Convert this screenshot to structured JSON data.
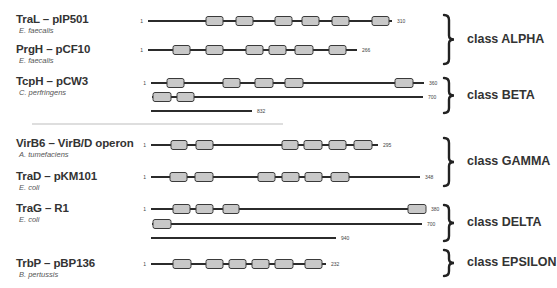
{
  "proteins": [
    {
      "name": "TraL – pIP501",
      "organism": "E. faecalis",
      "class": "ALPHA",
      "label_y": 13,
      "tracks": [
        {
          "y": 21,
          "x0": 148,
          "x1": 392,
          "start": "1",
          "end": "310",
          "domains": [
            [
              206,
              223
            ],
            [
              236,
              253
            ],
            [
              275,
              292
            ],
            [
              302,
              319
            ],
            [
              332,
              349
            ],
            [
              372,
              389
            ]
          ]
        }
      ]
    },
    {
      "name": "PrgH – pCF10",
      "organism": "E. faecalis",
      "class": "ALPHA",
      "label_y": 43,
      "tracks": [
        {
          "y": 50,
          "x0": 148,
          "x1": 357,
          "start": "1",
          "end": "266",
          "domains": [
            [
              173,
              190
            ],
            [
              206,
              223
            ],
            [
              246,
              263
            ],
            [
              269,
              286
            ],
            [
              295,
              313
            ],
            [
              329,
              346
            ]
          ]
        }
      ]
    },
    {
      "name": "TcpH – pCW3",
      "organism": "C. perfringens",
      "class": "BETA",
      "label_y": 75,
      "tracks": [
        {
          "y": 83,
          "x0": 151,
          "x1": 424,
          "start": "1",
          "end": "360",
          "domains": [
            [
              167,
              184
            ],
            [
              223,
              240
            ],
            [
              255,
              273
            ],
            [
              285,
              303
            ],
            [
              395,
              413
            ]
          ]
        },
        {
          "y": 97,
          "x0": 152,
          "x1": 423,
          "start": "",
          "end": "700",
          "domains": [
            [
              153,
              171
            ],
            [
              177,
              194
            ]
          ]
        },
        {
          "y": 111,
          "x0": 151,
          "x1": 252,
          "start": "",
          "end": "832",
          "domains": []
        }
      ]
    },
    {
      "name": "VirB6 – VirB/D operon",
      "organism": "A. tumefaciens",
      "class": "GAMMA",
      "label_y": 137,
      "tracks": [
        {
          "y": 145,
          "x0": 151,
          "x1": 378,
          "start": "1",
          "end": "295",
          "domains": [
            [
              171,
              187
            ],
            [
              196,
              213
            ],
            [
              282,
              298
            ],
            [
              304,
              322
            ],
            [
              329,
              346
            ],
            [
              354,
              372
            ]
          ]
        }
      ]
    },
    {
      "name": "TraD – pKM101",
      "organism": "E. coli",
      "class": "GAMMA",
      "label_y": 170,
      "tracks": [
        {
          "y": 177,
          "x0": 151,
          "x1": 420,
          "start": "1",
          "end": "348",
          "domains": [
            [
              170,
              187
            ],
            [
              195,
              213
            ],
            [
              258,
              275
            ],
            [
              282,
              299
            ],
            [
              305,
              322
            ],
            [
              331,
              349
            ]
          ]
        }
      ]
    },
    {
      "name": "TraG – R1",
      "organism": "E. coli",
      "class": "DELTA",
      "label_y": 202,
      "tracks": [
        {
          "y": 209,
          "x0": 151,
          "x1": 426,
          "start": "1",
          "end": "380",
          "domains": [
            [
              173,
              190
            ],
            [
              196,
              213
            ],
            [
              223,
              239
            ],
            [
              408,
              426
            ]
          ]
        },
        {
          "y": 224,
          "x0": 152,
          "x1": 422,
          "start": "",
          "end": "700",
          "domains": [
            [
              153,
              171
            ]
          ]
        },
        {
          "y": 238,
          "x0": 151,
          "x1": 336,
          "start": "",
          "end": "940",
          "domains": []
        }
      ]
    },
    {
      "name": "TrbP – pBP136",
      "organism": "B. pertussis",
      "class": "EPSILON",
      "label_y": 257,
      "tracks": [
        {
          "y": 264,
          "x0": 151,
          "x1": 326,
          "start": "1",
          "end": "232",
          "domains": [
            [
              173,
              191
            ],
            [
              206,
              223
            ],
            [
              229,
              246
            ],
            [
              252,
              269
            ],
            [
              275,
              293
            ],
            [
              305,
              322
            ]
          ]
        }
      ]
    }
  ],
  "classes": [
    {
      "label": "class ALPHA",
      "y0": 15,
      "y1": 64
    },
    {
      "label": "class BETA",
      "y0": 78,
      "y1": 113
    },
    {
      "label": "class GAMMA",
      "y0": 138,
      "y1": 186
    },
    {
      "label": "class DELTA",
      "y0": 205,
      "y1": 241
    },
    {
      "label": "class EPSILON",
      "y0": 250,
      "y1": 276
    }
  ],
  "divider": {
    "x0": 32,
    "x1": 283,
    "y": 124
  },
  "colors": {
    "backbone": "#2b2b2b",
    "domain_fill": "#c8c8c8",
    "domain_stroke": "#3a3a3a",
    "text": "#333333",
    "divider": "#bdbdbd"
  }
}
